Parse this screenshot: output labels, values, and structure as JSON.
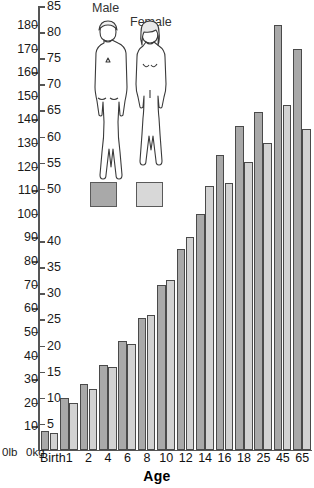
{
  "chart_data": {
    "type": "bar",
    "title": "",
    "xlabel": "Age",
    "ylabel": "",
    "categories": [
      "Birth",
      "1",
      "2",
      "4",
      "6",
      "8",
      "10",
      "12",
      "14",
      "16",
      "18",
      "25",
      "45",
      "65"
    ],
    "series": [
      {
        "name": "Male",
        "color": "#a9a9a9",
        "values_lb": [
          8,
          22,
          28,
          36,
          46,
          56,
          70,
          85,
          100,
          125,
          137,
          143,
          180,
          170
        ],
        "values_kg": [
          3.6,
          10,
          12.7,
          16.3,
          20.9,
          25.4,
          31.8,
          38.6,
          45.4,
          56.7,
          62.1,
          64.9,
          81.6,
          77.1
        ]
      },
      {
        "name": "Female",
        "color": "#d2d2d2",
        "values_lb": [
          7,
          20,
          26,
          35,
          45,
          57,
          72,
          90,
          112,
          113,
          122,
          130,
          146,
          136
        ],
        "values_kg": [
          3.2,
          9.1,
          11.8,
          15.9,
          20.4,
          25.9,
          32.7,
          40.8,
          50.8,
          51.3,
          55.3,
          59.0,
          66.2,
          61.7
        ]
      }
    ],
    "axis_lb": {
      "label": "0lb",
      "unit": "lb",
      "ticks": [
        10,
        20,
        30,
        40,
        50,
        60,
        70,
        80,
        90,
        100,
        110,
        120,
        130,
        140,
        150,
        160,
        170,
        180
      ],
      "min": 0,
      "max": 188
    },
    "axis_kg": {
      "label": "0kg",
      "unit": "kg",
      "ticks": [
        5,
        10,
        15,
        20,
        25,
        30,
        35,
        40,
        50,
        55,
        60,
        65,
        70,
        75,
        80,
        85
      ],
      "min": 0,
      "max": 85
    },
    "legend": {
      "position": "top-center",
      "male_label": "Male",
      "female_label": "Female",
      "male_color": "#a9a9a9",
      "female_color": "#d8d8d8"
    },
    "grid": false
  }
}
